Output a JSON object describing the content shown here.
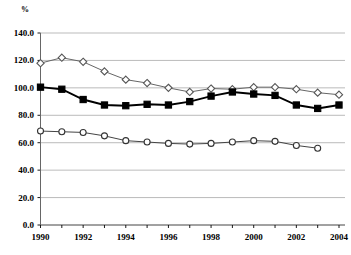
{
  "chart_data": {
    "type": "line",
    "title": "",
    "subtitle": "",
    "xlabel": "",
    "ylabel": "%",
    "unit_label": "%",
    "x": [
      1990,
      1991,
      1992,
      1993,
      1994,
      1995,
      1996,
      1997,
      1998,
      1999,
      2000,
      2001,
      2002,
      2003,
      2004
    ],
    "xlim": [
      1990,
      2004
    ],
    "ylim": [
      0.0,
      140.0
    ],
    "y_ticks": [
      0.0,
      20.0,
      40.0,
      60.0,
      80.0,
      100.0,
      120.0,
      140.0
    ],
    "y_tick_labels": [
      "0.0",
      "20.0",
      "40.0",
      "60.0",
      "80.0",
      "100.0",
      "120.0",
      "140.0"
    ],
    "x_ticks": [
      1990,
      1991,
      1992,
      1993,
      1994,
      1995,
      1996,
      1997,
      1998,
      1999,
      2000,
      2001,
      2002,
      2003,
      2004
    ],
    "x_tick_labels": [
      "1990",
      "",
      "1992",
      "",
      "1994",
      "",
      "1996",
      "",
      "1998",
      "",
      "2000",
      "",
      "2002",
      "",
      "2004"
    ],
    "grid": "horizontal",
    "legend": "none",
    "legend_position": "none",
    "series": [
      {
        "name": "series-open-diamond",
        "marker": "open-diamond",
        "marker_fill": "#ffffff",
        "marker_stroke": "#555555",
        "line_color": "#666666",
        "x": [
          1990,
          1991,
          1992,
          1993,
          1994,
          1995,
          1996,
          1997,
          1998,
          1999,
          2000,
          2001,
          2002,
          2003,
          2004
        ],
        "values": [
          118.0,
          122.0,
          119.0,
          112.0,
          106.0,
          103.5,
          100.0,
          97.0,
          99.5,
          99.0,
          100.5,
          100.5,
          99.0,
          96.5,
          95.0
        ]
      },
      {
        "name": "series-filled-square",
        "marker": "filled-square",
        "marker_fill": "#000000",
        "marker_stroke": "#000000",
        "line_color": "#000000",
        "x": [
          1990,
          1991,
          1992,
          1993,
          1994,
          1995,
          1996,
          1997,
          1998,
          1999,
          2000,
          2001,
          2002,
          2003,
          2004
        ],
        "values": [
          100.5,
          99.0,
          91.5,
          87.5,
          87.0,
          88.0,
          87.5,
          90.0,
          94.0,
          97.0,
          95.5,
          94.5,
          87.5,
          85.0,
          87.5
        ]
      },
      {
        "name": "series-open-circle",
        "marker": "open-circle",
        "marker_fill": "#ffffff",
        "marker_stroke": "#333333",
        "line_color": "#444444",
        "x": [
          1990,
          1991,
          1992,
          1993,
          1994,
          1995,
          1996,
          1997,
          1998,
          1999,
          2000,
          2001,
          2002,
          2003
        ],
        "values": [
          68.5,
          68.0,
          67.5,
          65.0,
          61.5,
          60.5,
          59.5,
          59.0,
          59.5,
          60.5,
          61.5,
          61.0,
          58.0,
          56.0
        ]
      }
    ],
    "colors": {
      "grid": "#aaaaaa",
      "axis": "#666666",
      "text": "#000000",
      "background": "#ffffff"
    }
  }
}
